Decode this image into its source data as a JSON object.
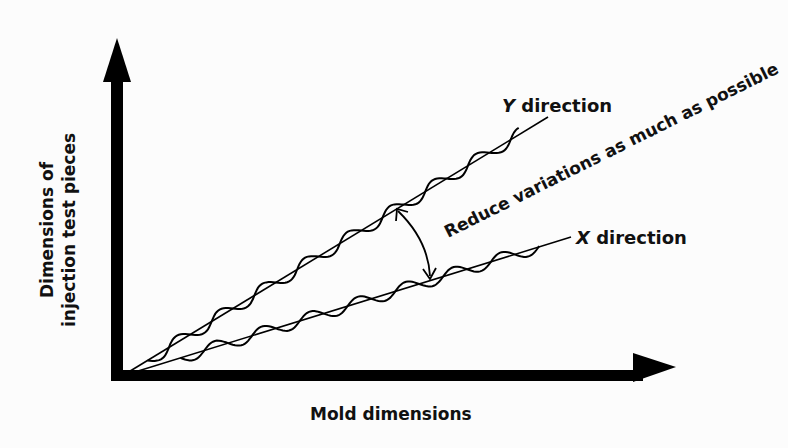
{
  "diagram": {
    "x_axis_label": "Mold dimensions",
    "y_axis_label_line1": "Dimensions of",
    "y_axis_label_line2": "injection test pieces",
    "series": [
      {
        "name": "Y direction",
        "label": "Y direction",
        "italic_prefix": "Y",
        "suffix": " direction"
      },
      {
        "name": "X direction",
        "label": "X direction",
        "italic_prefix": "X",
        "suffix": " direction"
      }
    ],
    "annotation": "Reduce variations as much as possible",
    "colors": {
      "ink": "#000000",
      "background": "#fcfcfc"
    }
  }
}
